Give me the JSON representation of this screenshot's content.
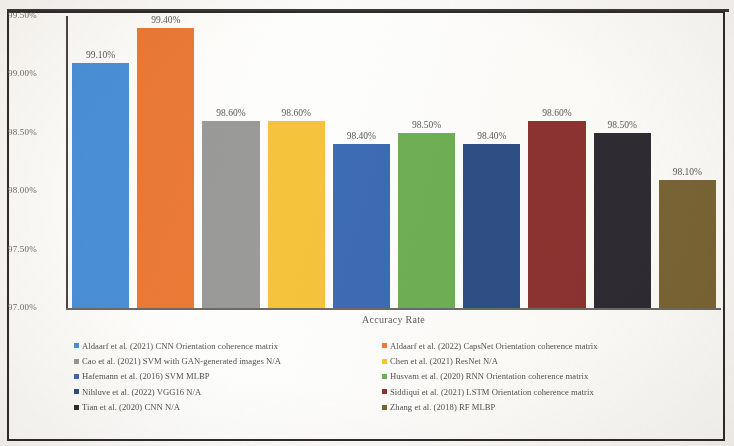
{
  "chart_data": {
    "type": "bar",
    "title": "",
    "xlabel": "Accuracy Rate",
    "ylabel": "",
    "ylim": [
      97.0,
      99.5
    ],
    "ytick_labels": [
      "99.50%",
      "99.00%",
      "98.50%",
      "98.00%",
      "97.50%",
      "97.00%"
    ],
    "ytick_values": [
      99.5,
      99.0,
      98.5,
      98.0,
      97.5,
      97.0
    ],
    "grid": false,
    "legend_position": "bottom",
    "categories": [
      "Aldaarf et al. (2021) CNN Orientation coherence matrix",
      "Aldaarf et al. (2022) CapsNet Orientation coherence matrix",
      "Cao et al. (2021) SVM with GAN-generated images N/A",
      "Chen et al. (2021) ResNet N/A",
      "Hafemann et al. (2016) SVM MLBP",
      "Husvam et al. (2020) RNN Orientation coherence matrix",
      "Nihluve et al. (2022) VGG16 N/A",
      "Siddiqui et al. (2021) LSTM Orientation coherence matrix",
      "Tian et al. (2020) CNN N/A",
      "Zhang et al. (2018) RF MLBP"
    ],
    "values": [
      99.1,
      99.4,
      98.6,
      98.6,
      98.4,
      98.5,
      98.4,
      98.6,
      98.5,
      98.1
    ],
    "value_labels": [
      "99.10%",
      "99.40%",
      "98.60%",
      "98.60%",
      "98.40%",
      "98.50%",
      "98.40%",
      "98.60%",
      "98.50%",
      "98.10%"
    ],
    "colors": [
      "#4a90d9",
      "#ea7a36",
      "#9a9a99",
      "#f5c33c",
      "#3d6bb5",
      "#6faf55",
      "#2f4f86",
      "#8c3330",
      "#2e2c33",
      "#7a6535"
    ]
  },
  "legend": {
    "items": [
      {
        "label": "Aldaarf et al. (2021) CNN Orientation coherence matrix",
        "color": "#4a90d9",
        "column": "left"
      },
      {
        "label": "Aldaarf et al. (2022) CapsNet Orientation coherence matrix",
        "color": "#ea7a36",
        "column": "right"
      },
      {
        "label": "Cao et al. (2021) SVM with GAN-generated images N/A",
        "color": "#9a9a99",
        "column": "left"
      },
      {
        "label": "Chen et al. (2021) ResNet N/A",
        "color": "#f5c33c",
        "column": "right"
      },
      {
        "label": "Hafemann et al. (2016) SVM MLBP",
        "color": "#3d6bb5",
        "column": "left"
      },
      {
        "label": "Husvam et al. (2020) RNN Orientation coherence matrix",
        "color": "#6faf55",
        "column": "right"
      },
      {
        "label": "Nihluve et al. (2022) VGG16 N/A",
        "color": "#2f4f86",
        "column": "left"
      },
      {
        "label": "Siddiqui et al. (2021) LSTM Orientation coherence matrix",
        "color": "#8c3330",
        "column": "right"
      },
      {
        "label": "Tian et al. (2020) CNN N/A",
        "color": "#2e2c33",
        "column": "left"
      },
      {
        "label": "Zhang et al. (2018) RF MLBP",
        "color": "#7a6535",
        "column": "right"
      }
    ]
  }
}
